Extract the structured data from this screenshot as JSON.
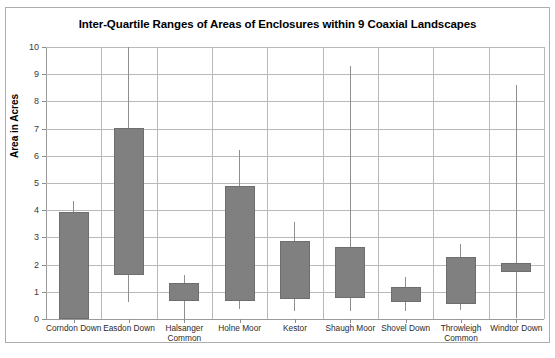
{
  "clipped_top_text": "",
  "caption": "",
  "chart_data": {
    "type": "bar",
    "title": "Inter-Quartile Ranges of Areas of Enclosures within 9 Coaxial Landscapes",
    "xlabel": "",
    "ylabel": "Area in Acres",
    "ylim": [
      0,
      10
    ],
    "ytick_labels": [
      "10",
      "9",
      "8",
      "7",
      "6",
      "5",
      "4",
      "3",
      "2",
      "1",
      "0"
    ],
    "ytick_values": [
      10,
      9,
      8,
      7,
      6,
      5,
      4,
      3,
      2,
      1,
      0
    ],
    "grid": true,
    "legend": "none",
    "bar_color": "#808080",
    "categories": [
      "Corndon Down",
      "Easdon Down",
      "Halsanger\nCommon",
      "Holne Moor",
      "Kestor",
      "Shaugh Moor",
      "Shovel Down",
      "Throwleigh\nCommon",
      "Windtor Down"
    ],
    "series": [
      {
        "name": "Inter-quartile range (box)",
        "q1": [
          0.0,
          1.62,
          0.65,
          0.65,
          0.72,
          0.78,
          0.62,
          0.55,
          1.72
        ],
        "q3": [
          3.93,
          7.02,
          1.32,
          4.88,
          2.88,
          2.65,
          1.19,
          2.28,
          2.05
        ]
      },
      {
        "name": "Whisker range (line)",
        "min": [
          0.0,
          0.62,
          0.0,
          0.35,
          0.3,
          0.3,
          0.28,
          0.32,
          0.05
        ],
        "max": [
          4.35,
          10.0,
          1.6,
          6.2,
          3.55,
          9.3,
          1.55,
          2.75,
          8.6
        ]
      }
    ],
    "values": [
      3.93,
      7.02,
      1.32,
      4.88,
      2.88,
      2.65,
      1.19,
      2.28,
      2.05
    ]
  }
}
